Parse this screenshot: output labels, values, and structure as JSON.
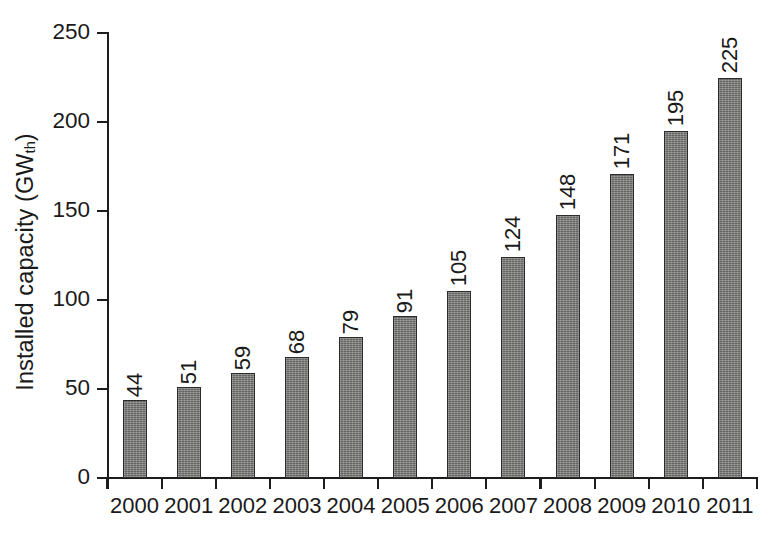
{
  "chart_data": {
    "type": "bar",
    "title": "",
    "xlabel": "",
    "ylabel": "Installed capacity (GW_th)",
    "ylabel_main": "Installed capacity (GW",
    "ylabel_sub": "th",
    "ylabel_tail": ")",
    "categories": [
      "2000",
      "2001",
      "2002",
      "2003",
      "2004",
      "2005",
      "2006",
      "2007",
      "2008",
      "2009",
      "2010",
      "2011"
    ],
    "values": [
      44,
      51,
      59,
      68,
      79,
      91,
      105,
      124,
      148,
      171,
      195,
      225
    ],
    "value_labels": [
      "44",
      "51",
      "59",
      "68",
      "79",
      "91",
      "105",
      "124",
      "148",
      "171",
      "195",
      "225"
    ],
    "ylim": [
      0,
      250
    ],
    "yticks": [
      0,
      50,
      100,
      150,
      200,
      250
    ],
    "ytick_labels": [
      "0",
      "50",
      "100",
      "150",
      "200",
      "250"
    ],
    "grid": false,
    "legend": null,
    "bar_color": "#80807e",
    "bar_edge_color": "#2b2b2b",
    "axis_color": "#1d1d1d",
    "text_color": "#1a1a1a",
    "background": "#ffffff"
  }
}
